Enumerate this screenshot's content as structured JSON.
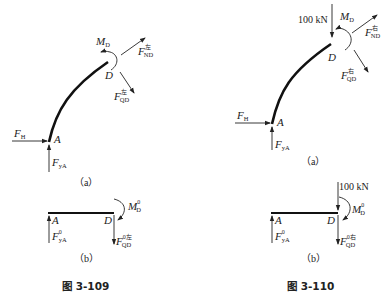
{
  "figures": [
    {
      "id": "fig-3-109",
      "caption": "图 3-109",
      "panel_a": {
        "label": "（a）",
        "point_labels": {
          "A": "A",
          "D": "D"
        },
        "forces": {
          "FH": {
            "main": "F",
            "sub": "H"
          },
          "FyA": {
            "main": "F",
            "sub": "yA"
          },
          "MD": {
            "main": "M",
            "sub": "D"
          },
          "FND": {
            "main": "F",
            "sub": "ND",
            "sup": "左"
          },
          "FQD": {
            "main": "F",
            "sub": "QD",
            "sup": "左"
          }
        }
      },
      "panel_b": {
        "label": "（b）",
        "point_labels": {
          "A": "A",
          "D": "D"
        },
        "forces": {
          "FyA0": {
            "main": "F",
            "sub": "yA",
            "sup": "0"
          },
          "MD0": {
            "main": "M",
            "sub": "D",
            "sup": "0"
          },
          "FQD0": {
            "main": "F",
            "sub": "QD",
            "sup": "0左"
          }
        }
      }
    },
    {
      "id": "fig-3-110",
      "caption": "图 3-110",
      "panel_a": {
        "label": "（a）",
        "load": "100 kN",
        "point_labels": {
          "A": "A",
          "D": "D"
        },
        "forces": {
          "FH": {
            "main": "F",
            "sub": "H"
          },
          "FyA": {
            "main": "F",
            "sub": "yA"
          },
          "MD": {
            "main": "M",
            "sub": "D"
          },
          "FND": {
            "main": "F",
            "sub": "ND",
            "sup": "右"
          },
          "FQD": {
            "main": "F",
            "sub": "QD",
            "sup": "右"
          }
        }
      },
      "panel_b": {
        "label": "（b）",
        "load": "100 kN",
        "point_labels": {
          "A": "A",
          "D": "D"
        },
        "forces": {
          "FyA0": {
            "main": "F",
            "sub": "yA",
            "sup": "0"
          },
          "MD0": {
            "main": "M",
            "sub": "D",
            "sup": "0"
          },
          "FQD0": {
            "main": "F",
            "sub": "QD",
            "sup": "0右"
          }
        }
      }
    }
  ]
}
